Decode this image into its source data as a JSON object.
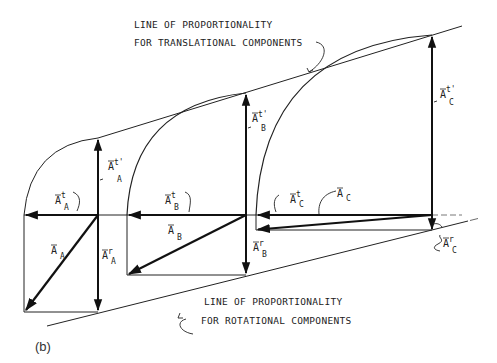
{
  "figure": {
    "caption": "(b)",
    "top_annotation": {
      "line1": "LINE OF PROPORTIONALITY",
      "line2": "FOR TRANSLATIONAL COMPONENTS"
    },
    "bottom_annotation": {
      "line1": "LINE OF PROPORTIONALITY",
      "line2": "FOR ROTATIONAL COMPONENTS"
    },
    "points": [
      {
        "name": "A",
        "labels": {
          "total": {
            "base": "A",
            "sub": "A",
            "sup": ""
          },
          "tangential": {
            "base": "A",
            "sub": "A",
            "sup": "t"
          },
          "tangential_prime": {
            "base": "A",
            "sub": "A",
            "sup": "t'"
          },
          "rotational": {
            "base": "A",
            "sub": "A",
            "sup": "r"
          }
        }
      },
      {
        "name": "B",
        "labels": {
          "total": {
            "base": "A",
            "sub": "B",
            "sup": ""
          },
          "tangential": {
            "base": "A",
            "sub": "B",
            "sup": "t"
          },
          "tangential_prime": {
            "base": "A",
            "sub": "B",
            "sup": "t'"
          },
          "rotational": {
            "base": "A",
            "sub": "B",
            "sup": "r"
          }
        }
      },
      {
        "name": "C",
        "labels": {
          "total": {
            "base": "A",
            "sub": "C",
            "sup": ""
          },
          "tangential": {
            "base": "A",
            "sub": "C",
            "sup": "t"
          },
          "tangential_prime": {
            "base": "A",
            "sub": "C",
            "sup": "t'"
          },
          "rotational": {
            "base": "A",
            "sub": "C",
            "sup": "r"
          }
        }
      }
    ]
  }
}
